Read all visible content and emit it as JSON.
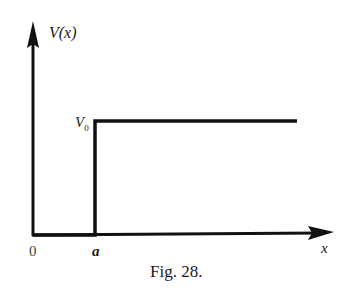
{
  "diagram": {
    "type": "step-potential",
    "y_axis_label": "V(x)",
    "x_axis_label": "x",
    "step_height_label_main": "V",
    "step_height_label_sub": "0",
    "origin_label": "0",
    "step_position_label": "a",
    "caption": "Fig. 28.",
    "line_color": "#111111",
    "geometry": {
      "origin": [
        33,
        235
      ],
      "y_axis_top": [
        33,
        22
      ],
      "x_axis_end": [
        333,
        235
      ],
      "step_x": 95,
      "step_top_y": 121,
      "step_line_end_x": 297
    }
  }
}
